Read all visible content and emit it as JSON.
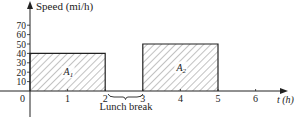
{
  "chart_data": {
    "type": "bar",
    "title": "",
    "xlabel": "t (h)",
    "ylabel": "Speed (mi/h)",
    "x_ticks": [
      "1",
      "2",
      "3",
      "4",
      "5",
      "6"
    ],
    "y_ticks": [
      "10",
      "20",
      "30",
      "40",
      "50",
      "60",
      "70"
    ],
    "origin_label": "0",
    "xlim": [
      0,
      7
    ],
    "ylim": [
      0,
      70
    ],
    "grid": false,
    "bars": [
      {
        "label": "A1",
        "label_main": "A",
        "label_sub": "1",
        "x_start": 0,
        "x_end": 2,
        "value": 40,
        "fill": "hatched"
      },
      {
        "label": "A2",
        "label_main": "A",
        "label_sub": "2",
        "x_start": 3,
        "x_end": 5,
        "value": 50,
        "fill": "hatched"
      }
    ],
    "annotations": [
      {
        "text": "Lunch break",
        "x_start": 2,
        "x_end": 3,
        "style": "brace below axis"
      }
    ]
  },
  "colors": {
    "ink": "#222222",
    "hatch": "#555555",
    "background": "#ffffff"
  }
}
